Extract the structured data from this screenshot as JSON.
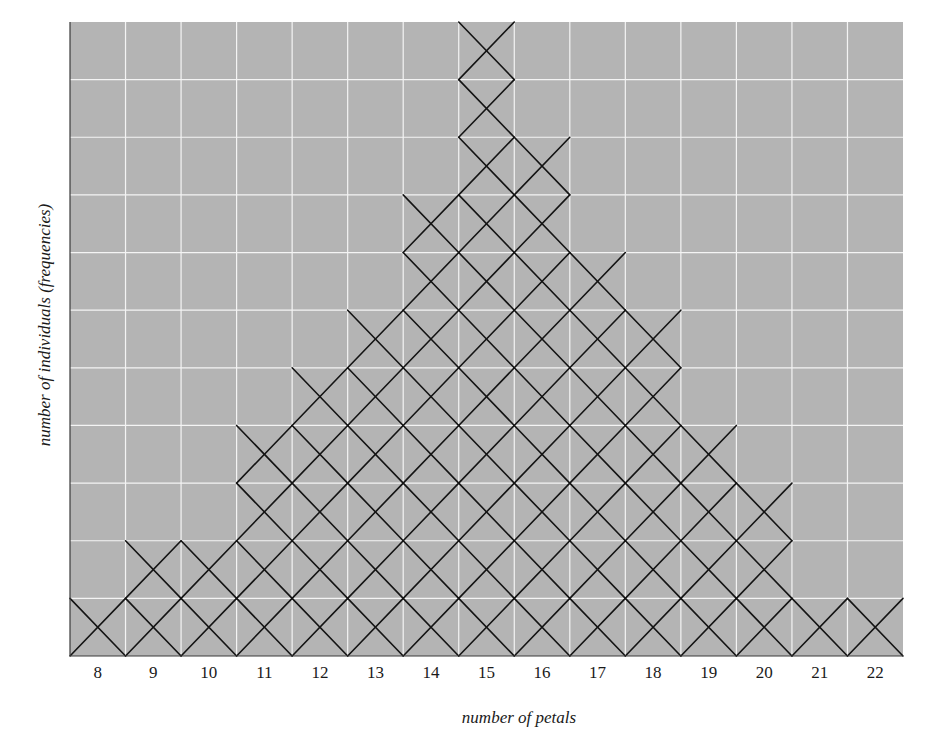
{
  "chart_data": {
    "type": "bar",
    "style": "stacked-x-marks (one X per individual)",
    "title": "",
    "xlabel": "number of petals",
    "ylabel": "number of individuals (frequencies)",
    "categories": [
      "8",
      "9",
      "10",
      "11",
      "12",
      "13",
      "14",
      "15",
      "16",
      "17",
      "18",
      "19",
      "20",
      "21",
      "22"
    ],
    "values": [
      1,
      2,
      2,
      4,
      5,
      6,
      8,
      11,
      9,
      7,
      6,
      4,
      3,
      1,
      1
    ],
    "total": 70,
    "ylim": [
      0,
      11
    ],
    "grid": true,
    "legend": null
  },
  "layout": {
    "plot_left": 70,
    "plot_top": 22,
    "plot_right": 903,
    "plot_bottom": 656,
    "rows": 11
  },
  "colors": {
    "plot_background": "#b4b4b4",
    "grid_line": "#f4f4f4",
    "mark": "#141414",
    "axis": "#3a3a3a",
    "text": "#1a1a1a"
  },
  "axes": {
    "x_title": "number of petals",
    "y_title": "number of individuals (frequencies)"
  }
}
